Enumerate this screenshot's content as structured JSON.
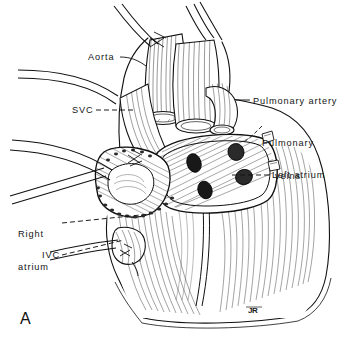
{
  "figure": {
    "panel_letter": "A",
    "artist_monogram": "JR",
    "ink_color": "#111111",
    "background_color": "#ffffff",
    "labels": [
      {
        "id": "aorta",
        "text": "Aorta",
        "x": 88,
        "y": 52,
        "lines": [
          "Aorta"
        ]
      },
      {
        "id": "svc",
        "text": "SVC",
        "x": 72,
        "y": 105,
        "lines": [
          "SVC"
        ]
      },
      {
        "id": "pulmonary-artery",
        "text": "Pulmonary artery",
        "x": 253,
        "y": 96,
        "lines": [
          "Pulmonary artery"
        ]
      },
      {
        "id": "pulmonary-veins",
        "text": "Pulmonary veins",
        "x": 262,
        "y": 116,
        "lines": [
          "Pulmonary",
          "veins"
        ]
      },
      {
        "id": "left-atrium",
        "text": "Left atrium",
        "x": 272,
        "y": 170,
        "lines": [
          "Left atrium"
        ]
      },
      {
        "id": "right-atrium",
        "text": "Right atrium",
        "x": 18,
        "y": 207,
        "lines": [
          "Right",
          "atrium"
        ]
      },
      {
        "id": "ivc",
        "text": "IVC",
        "x": 42,
        "y": 250,
        "lines": [
          "IVC"
        ]
      }
    ]
  }
}
